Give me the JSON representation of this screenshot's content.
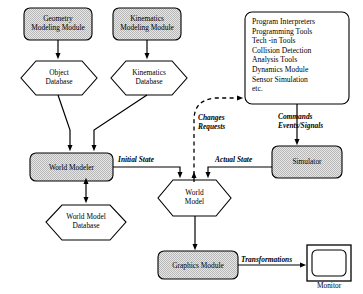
{
  "diagram": {
    "background_color": "#ffffff",
    "node_fill_color": "#d9d9d9",
    "node_stroke_color": "#000000",
    "hexagon_fill_color": "#ffffff"
  },
  "nodes": {
    "geometry_modeling_module": {
      "label": "Geometry\nModeling Module",
      "shape": "rounded-rect",
      "fill": "#d9d9d9"
    },
    "kinematics_modeling_module": {
      "label": "Kinematics\nModeling Module",
      "shape": "rounded-rect",
      "fill": "#d9d9d9"
    },
    "object_database": {
      "label": "Object\nDatabase",
      "shape": "hexagon",
      "fill": "#ffffff"
    },
    "kinematics_database": {
      "label": "Kinematics\nDatabase",
      "shape": "hexagon",
      "fill": "#ffffff"
    },
    "world_modeler": {
      "label": "World Modeler",
      "shape": "rounded-rect",
      "fill": "#d9d9d9"
    },
    "world_model_database": {
      "label": "World Model\nDatabase",
      "shape": "hexagon",
      "fill": "#ffffff"
    },
    "tools": {
      "shape": "rounded-rect",
      "fill": "#ffffff",
      "items": [
        "Program Interpreters",
        "Programming Tools",
        "Tech -in Tools",
        "Collision Detection",
        "Analysis Tools",
        "Dynamics Module",
        "Sensor Simulation",
        "etc."
      ]
    },
    "simulator": {
      "label": "Simulator",
      "shape": "rounded-rect",
      "fill": "#d9d9d9"
    },
    "world_model": {
      "label": "World\nModel",
      "shape": "hexagon",
      "fill": "#ffffff"
    },
    "graphics_module": {
      "label": "Graphics Module",
      "shape": "rounded-rect",
      "fill": "#d9d9d9"
    },
    "monitor": {
      "label": "Monitor",
      "shape": "monitor",
      "fill": "#ffffff"
    }
  },
  "edge_labels": {
    "changes_requests": "Changes\nRequests",
    "commands_events_signals": "Commands\nEvents/Signals",
    "initial_state": "Initial State",
    "actual_state": "Actual State",
    "transformations": "Transformations"
  }
}
